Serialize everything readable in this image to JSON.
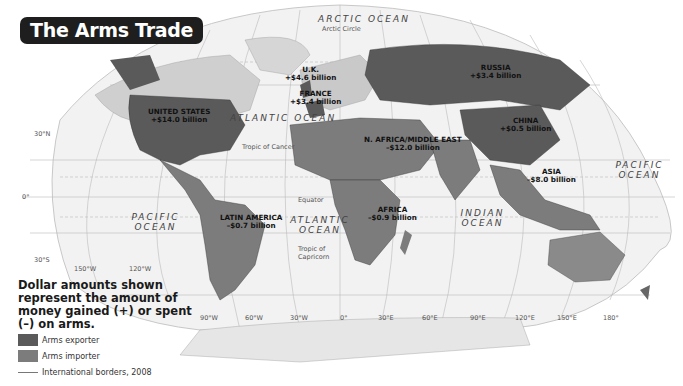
{
  "title": "The Arms Trade",
  "regions": [
    {
      "name": "UNITED STATES",
      "value": "+$14.0 billion",
      "type": "exporter"
    },
    {
      "name": "U.K.",
      "value": "+$4.6 billion",
      "type": "exporter"
    },
    {
      "name": "FRANCE",
      "value": "+$3.4 billion",
      "type": "exporter"
    },
    {
      "name": "RUSSIA",
      "value": "+$3.4 billion",
      "type": "exporter"
    },
    {
      "name": "CHINA",
      "value": "+$0.5 billion",
      "type": "exporter"
    },
    {
      "name": "N. AFRICA/MIDDLE EAST",
      "value": "–$12.0 billion",
      "type": "importer"
    },
    {
      "name": "ASIA",
      "value": "–$8.0 billion",
      "type": "importer"
    },
    {
      "name": "AFRICA",
      "value": "–$0.9 billion",
      "type": "importer"
    },
    {
      "name": "LATIN AMERICA",
      "value": "–$0.7 billion",
      "type": "importer"
    }
  ],
  "oceans": {
    "arctic": "ARCTIC OCEAN",
    "atlantic_n": "ATLANTIC OCEAN",
    "atlantic_s": "ATLANTIC OCEAN",
    "pacific_e": "PACIFIC OCEAN",
    "pacific_w": "PACIFIC OCEAN",
    "indian": "INDIAN OCEAN"
  },
  "lines": {
    "arctic_circle": "Arctic Circle",
    "tropic_cancer": "Tropic of Cancer",
    "equator": "Equator",
    "tropic_capricorn": "Tropic of Capricorn"
  },
  "lat_labels": [
    "30°N",
    "0°",
    "30°S"
  ],
  "lon_labels": [
    "150°W",
    "120°W",
    "90°W",
    "60°W",
    "30°W",
    "0°",
    "30°E",
    "60°E",
    "90°E",
    "120°E",
    "150°E",
    "180°"
  ],
  "legend": {
    "title": "Dollar amounts shown represent the amount of money gained (+) or spent (–) on arms.",
    "items": [
      {
        "label": "Arms exporter",
        "color": "#5a5a5a"
      },
      {
        "label": "Arms importer",
        "color": "#7c7c7c"
      },
      {
        "label": "International borders, 2008",
        "color": "#777777"
      }
    ]
  },
  "colors": {
    "exporter": "#5a5a5a",
    "importer": "#7c7c7c",
    "other_land": "#cfcfcf",
    "ocean": "#f4f4f4"
  }
}
